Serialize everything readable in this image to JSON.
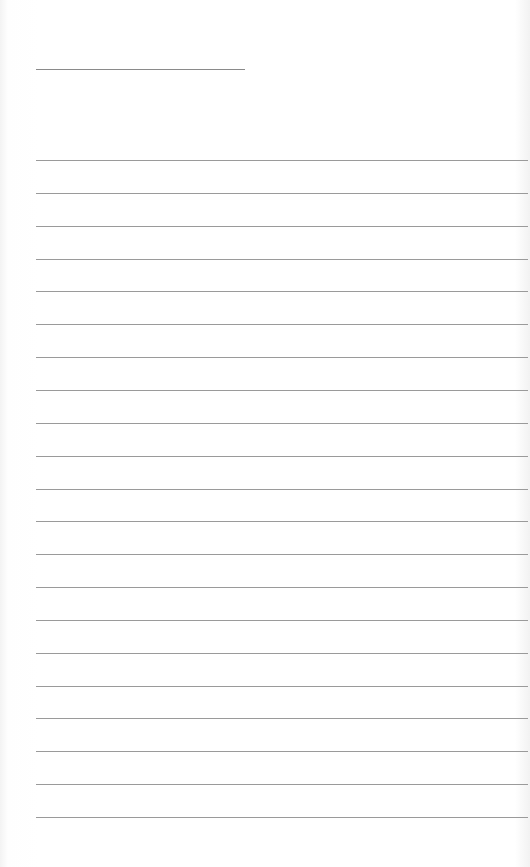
{
  "document": {
    "type": "lined-paper",
    "title_line": {
      "text": ""
    },
    "rule_count": 21,
    "rules": [
      "",
      "",
      "",
      "",
      "",
      "",
      "",
      "",
      "",
      "",
      "",
      "",
      "",
      "",
      "",
      "",
      "",
      "",
      "",
      "",
      ""
    ],
    "line_color": "#9a9a9a",
    "background_color": "#ffffff"
  }
}
